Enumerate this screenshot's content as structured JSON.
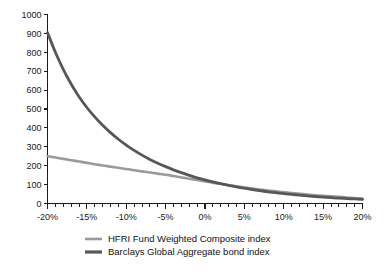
{
  "chart_data": {
    "type": "line",
    "title": "",
    "subtitle": "",
    "xlabel": "",
    "ylabel": "",
    "xlim": [
      -20,
      20
    ],
    "ylim": [
      0,
      1000
    ],
    "grid": false,
    "legend_position": "bottom",
    "x_tick_labels": [
      "-20%",
      "-15%",
      "-10%",
      "-5%",
      "0%",
      "5%",
      "10%",
      "15%",
      "20%"
    ],
    "x_tick_values": [
      -20,
      -15,
      -10,
      -5,
      0,
      5,
      10,
      15,
      20
    ],
    "x_minor_step": 1,
    "y_tick_labels": [
      "0",
      "100",
      "200",
      "300",
      "400",
      "500",
      "600",
      "700",
      "800",
      "900",
      "1000"
    ],
    "y_tick_values": [
      0,
      100,
      200,
      300,
      400,
      500,
      600,
      700,
      800,
      900,
      1000
    ],
    "x": [
      -20,
      -19,
      -18,
      -17,
      -16,
      -15,
      -14,
      -13,
      -12,
      -11,
      -10,
      -9,
      -8,
      -7,
      -6,
      -5,
      -4,
      -3,
      -2,
      -1,
      0,
      1,
      2,
      3,
      4,
      5,
      6,
      7,
      8,
      9,
      10,
      11,
      12,
      13,
      14,
      15,
      16,
      17,
      18,
      19,
      20
    ],
    "series": [
      {
        "name": "HFRI Fund Weighted Composite index",
        "color": "#9a9a9a",
        "width": 2.6,
        "values": [
          250,
          243,
          236,
          229,
          222,
          215,
          208,
          201,
          195,
          189,
          183,
          176,
          170,
          164,
          158,
          152,
          145,
          138,
          131,
          124,
          117,
          110,
          103,
          97,
          91,
          85,
          79,
          74,
          69,
          64,
          60,
          56,
          52,
          48,
          44,
          41,
          38,
          35,
          32,
          29,
          26
        ]
      },
      {
        "name": "Barclays Global Aggregate bond index",
        "color": "#575757",
        "width": 2.8,
        "values": [
          905,
          800,
          710,
          632,
          565,
          508,
          458,
          414,
          375,
          340,
          309,
          281,
          256,
          233,
          213,
          195,
          178,
          163,
          149,
          136,
          125,
          114,
          105,
          96,
          88,
          81,
          74,
          68,
          62,
          57,
          52,
          48,
          44,
          40,
          37,
          34,
          31,
          28,
          26,
          24,
          22
        ]
      }
    ],
    "legend": [
      {
        "label": "HFRI Fund Weighted Composite index",
        "color": "#9a9a9a",
        "width": 2.6
      },
      {
        "label": "Barclays Global Aggregate bond index",
        "color": "#575757",
        "width": 3.2
      }
    ]
  },
  "colors": {
    "axis": "#1a1a1a",
    "background": "#ffffff",
    "series_light": "#9a9a9a",
    "series_dark": "#575757"
  }
}
